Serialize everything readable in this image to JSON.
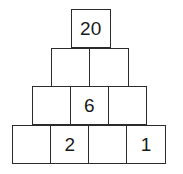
{
  "figure": {
    "name": "number-pyramid",
    "border_color": "#2b2b2b",
    "fill_color": "#ffffff",
    "text_color": "#1a1a1a",
    "rows": [
      {
        "index": 1,
        "cells": [
          {
            "value": "20",
            "empty": false
          }
        ]
      },
      {
        "index": 2,
        "cells": [
          {
            "value": "",
            "empty": true
          },
          {
            "value": "",
            "empty": true
          }
        ]
      },
      {
        "index": 3,
        "cells": [
          {
            "value": "",
            "empty": true
          },
          {
            "value": "6",
            "empty": false
          },
          {
            "value": "",
            "empty": true
          }
        ]
      },
      {
        "index": 4,
        "cells": [
          {
            "value": "",
            "empty": true
          },
          {
            "value": "2",
            "empty": false
          },
          {
            "value": "",
            "empty": true
          },
          {
            "value": "1",
            "empty": false
          }
        ]
      }
    ]
  }
}
